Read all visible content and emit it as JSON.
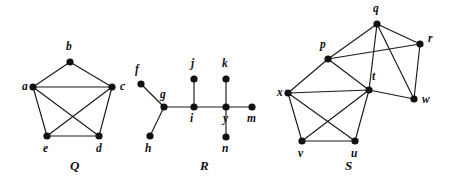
{
  "figure": {
    "background_color": "#ffffff",
    "vertex_color": "#111111",
    "edge_color": "#1a1a1a",
    "width": 452,
    "height": 185
  },
  "graphs": [
    {
      "name": "Q",
      "caption": "Q",
      "caption_pos": {
        "x": 70,
        "y": 170
      },
      "vertices": [
        {
          "id": "a",
          "label": "a",
          "x": 33,
          "y": 87,
          "lx": 22,
          "ly": 90
        },
        {
          "id": "b",
          "label": "b",
          "x": 70,
          "y": 62,
          "lx": 66,
          "ly": 50
        },
        {
          "id": "c",
          "label": "c",
          "x": 112,
          "y": 87,
          "lx": 120,
          "ly": 90
        },
        {
          "id": "d",
          "label": "d",
          "x": 99,
          "y": 136,
          "lx": 96,
          "ly": 152
        },
        {
          "id": "e",
          "label": "e",
          "x": 47,
          "y": 136,
          "lx": 43,
          "ly": 152
        }
      ],
      "edges": [
        [
          "a",
          "b"
        ],
        [
          "b",
          "c"
        ],
        [
          "a",
          "c"
        ],
        [
          "a",
          "e"
        ],
        [
          "c",
          "d"
        ],
        [
          "e",
          "d"
        ],
        [
          "a",
          "d"
        ],
        [
          "c",
          "e"
        ]
      ]
    },
    {
      "name": "R",
      "caption": "R",
      "caption_pos": {
        "x": 200,
        "y": 170
      },
      "vertices": [
        {
          "id": "f",
          "label": "f",
          "x": 141,
          "y": 84,
          "lx": 135,
          "ly": 73
        },
        {
          "id": "g",
          "label": "g",
          "x": 164,
          "y": 107,
          "lx": 160,
          "ly": 98
        },
        {
          "id": "h",
          "label": "h",
          "x": 150,
          "y": 136,
          "lx": 145,
          "ly": 152
        },
        {
          "id": "i",
          "label": "i",
          "x": 194,
          "y": 107,
          "lx": 190,
          "ly": 122
        },
        {
          "id": "j",
          "label": "j",
          "x": 194,
          "y": 79,
          "lx": 191,
          "ly": 67
        },
        {
          "id": "k",
          "label": "k",
          "x": 226,
          "y": 79,
          "lx": 222,
          "ly": 67
        },
        {
          "id": "y",
          "label": "y",
          "x": 226,
          "y": 107,
          "lx": 223,
          "ly": 122
        },
        {
          "id": "m",
          "label": "m",
          "x": 252,
          "y": 107,
          "lx": 247,
          "ly": 122
        },
        {
          "id": "n",
          "label": "n",
          "x": 226,
          "y": 137,
          "lx": 222,
          "ly": 152
        }
      ],
      "edges": [
        [
          "f",
          "g"
        ],
        [
          "g",
          "h"
        ],
        [
          "g",
          "i"
        ],
        [
          "i",
          "j"
        ],
        [
          "i",
          "y"
        ],
        [
          "y",
          "k"
        ],
        [
          "y",
          "m"
        ],
        [
          "y",
          "n"
        ]
      ]
    },
    {
      "name": "S",
      "caption": "S",
      "caption_pos": {
        "x": 345,
        "y": 170
      },
      "vertices": [
        {
          "id": "q",
          "label": "q",
          "x": 377,
          "y": 24,
          "lx": 373,
          "ly": 12
        },
        {
          "id": "p",
          "label": "p",
          "x": 328,
          "y": 59,
          "lx": 320,
          "ly": 48
        },
        {
          "id": "r",
          "label": "r",
          "x": 420,
          "y": 44,
          "lx": 428,
          "ly": 42
        },
        {
          "id": "t",
          "label": "t",
          "x": 369,
          "y": 90,
          "lx": 372,
          "ly": 80
        },
        {
          "id": "w",
          "label": "w",
          "x": 414,
          "y": 99,
          "lx": 422,
          "ly": 103
        },
        {
          "id": "x",
          "label": "x",
          "x": 288,
          "y": 93,
          "lx": 277,
          "ly": 96
        },
        {
          "id": "v",
          "label": "v",
          "x": 302,
          "y": 141,
          "lx": 298,
          "ly": 157
        },
        {
          "id": "u",
          "label": "u",
          "x": 355,
          "y": 141,
          "lx": 351,
          "ly": 157
        }
      ],
      "edges": [
        [
          "p",
          "q"
        ],
        [
          "q",
          "r"
        ],
        [
          "q",
          "w"
        ],
        [
          "r",
          "w"
        ],
        [
          "p",
          "r"
        ],
        [
          "p",
          "x"
        ],
        [
          "p",
          "t"
        ],
        [
          "t",
          "w"
        ],
        [
          "t",
          "q"
        ],
        [
          "x",
          "t"
        ],
        [
          "x",
          "v"
        ],
        [
          "x",
          "u"
        ],
        [
          "v",
          "u"
        ],
        [
          "v",
          "t"
        ],
        [
          "u",
          "t"
        ]
      ]
    }
  ]
}
